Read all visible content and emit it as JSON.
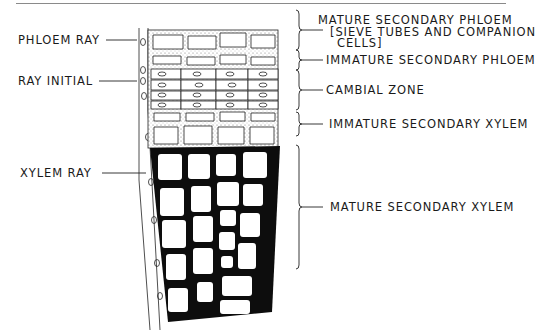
{
  "diagram": {
    "type": "botanical cross-section illustration",
    "left_labels": [
      {
        "id": "phloem-ray",
        "text": "PHLOEM RAY"
      },
      {
        "id": "ray-initial",
        "text": "RAY INITIAL"
      },
      {
        "id": "xylem-ray",
        "text": "XYLEM RAY"
      }
    ],
    "right_labels": [
      {
        "id": "mature-secondary-phloem",
        "lines": [
          "MATURE SECONDARY PHLOEM",
          "[SIEVE TUBES AND COMPANION",
          "CELLS]"
        ]
      },
      {
        "id": "immature-secondary-phloem",
        "text": "IMMATURE SECONDARY PHLOEM"
      },
      {
        "id": "cambial-zone",
        "text": "CAMBIAL ZONE"
      },
      {
        "id": "immature-secondary-xylem",
        "text": "IMMATURE SECONDARY XYLEM"
      },
      {
        "id": "mature-secondary-xylem",
        "text": "MATURE SECONDARY XYLEM"
      }
    ],
    "colors": {
      "ink": "#111111",
      "stipple": "#9a9a9a",
      "background": "#ffffff"
    }
  }
}
